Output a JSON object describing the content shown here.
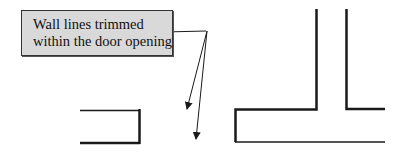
{
  "diagram": {
    "callout": {
      "lines": [
        "Wall lines trimmed",
        "within the door opening"
      ]
    },
    "colors": {
      "callout_fill": "#d9d9d9",
      "line": "#1a1a1a"
    },
    "walls": {
      "left_wall_end": "left-wall-stub",
      "right_wall": "t-junction-wall"
    }
  }
}
